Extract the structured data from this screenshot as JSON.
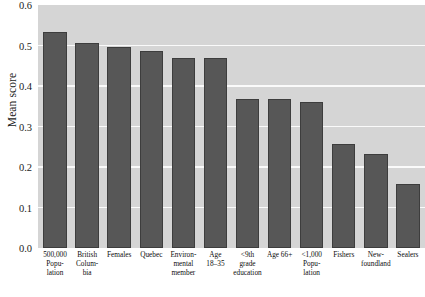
{
  "chart_data": {
    "type": "bar",
    "title": "",
    "xlabel": "",
    "ylabel": "Mean score",
    "ylim": [
      0.0,
      0.6
    ],
    "ytick_labels": [
      "0.6",
      "0.5",
      "0.4",
      "0.3",
      "0.2",
      "0.1",
      "0.0"
    ],
    "ytick_values": [
      0.6,
      0.5,
      0.4,
      0.3,
      0.2,
      0.1,
      0.0
    ],
    "grid": true,
    "gridlines_at": [
      0.5,
      0.4,
      0.3,
      0.2,
      0.1
    ],
    "legend": null,
    "categories": [
      "500,000 Popu-lation",
      "British Colum-bia",
      "Females",
      "Quebec",
      "Environ-mental member",
      "Age 18–35",
      "<9th grade education",
      "Age 66+",
      "<1,000 Popu-lation",
      "Fishers",
      "New-foundland",
      "Sealers"
    ],
    "category_lines": [
      [
        "500,000",
        "Popu-",
        "lation"
      ],
      [
        "British",
        "Colum-",
        "bia"
      ],
      [
        "Females"
      ],
      [
        "Quebec"
      ],
      [
        "Environ-",
        "mental",
        "member"
      ],
      [
        "Age",
        "18–35"
      ],
      [
        "<9th",
        "grade",
        "education"
      ],
      [
        "Age 66+"
      ],
      [
        "<1,000",
        "Popu-",
        "lation"
      ],
      [
        "Fishers"
      ],
      [
        "New-",
        "foundland"
      ],
      [
        "Sealers"
      ]
    ],
    "values": [
      0.534,
      0.506,
      0.497,
      0.487,
      0.468,
      0.468,
      0.368,
      0.368,
      0.36,
      0.256,
      0.231,
      0.157
    ],
    "colors": {
      "bar_fill": "#575757",
      "bar_edge": "#3d3d3d",
      "plot_background": "#d5d5d5",
      "gridline": "#fafafa",
      "figure_background": "#ffffff",
      "text": "#0d0d0d"
    }
  }
}
